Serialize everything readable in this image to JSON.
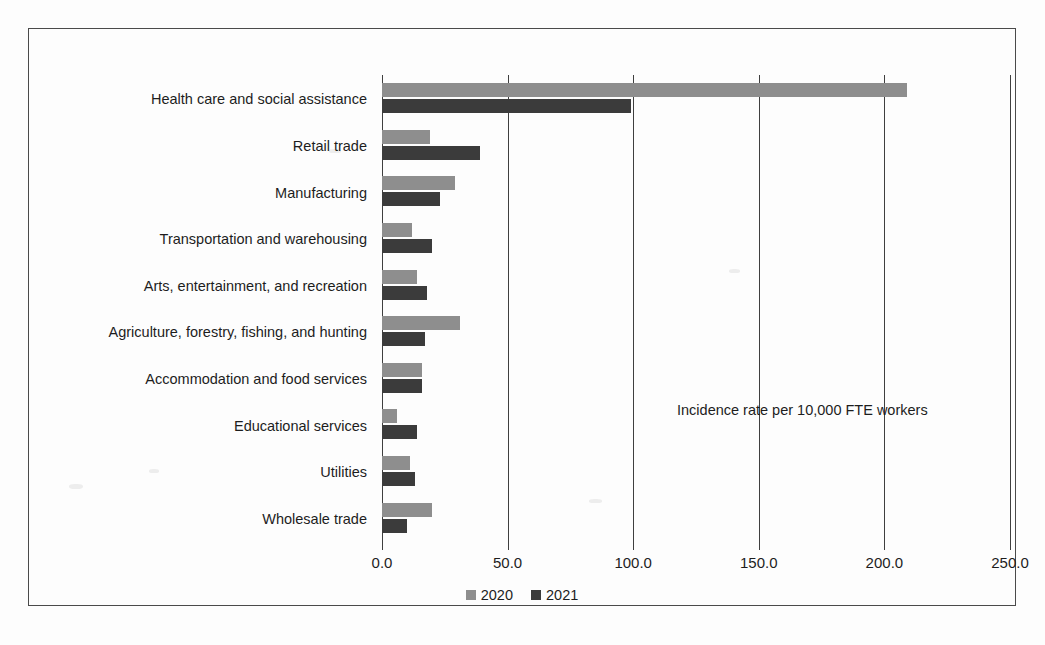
{
  "chart_data": {
    "type": "bar",
    "orientation": "horizontal",
    "title": "",
    "subtitle": "",
    "annotation": "Incidence rate per 10,000 FTE workers",
    "xlabel": "",
    "ylabel": "",
    "xlim": [
      0.0,
      250.0
    ],
    "xticks": [
      "0.0",
      "50.0",
      "100.0",
      "150.0",
      "200.0",
      "250.0"
    ],
    "xtick_values": [
      0,
      50,
      100,
      150,
      200,
      250
    ],
    "grid": "vertical",
    "legend_position": "bottom-center",
    "categories": [
      "Health care and social assistance",
      "Retail trade",
      "Manufacturing",
      "Transportation and warehousing",
      "Arts, entertainment, and recreation",
      "Agriculture, forestry, fishing, and hunting",
      "Accommodation and food services",
      "Educational services",
      "Utilities",
      "Wholesale trade"
    ],
    "series": [
      {
        "name": "2020",
        "color": "#8e8e8e",
        "values": [
          209.0,
          19.0,
          29.0,
          12.0,
          14.0,
          31.0,
          16.0,
          6.0,
          11.0,
          20.0
        ]
      },
      {
        "name": "2021",
        "color": "#3b3b3b",
        "values": [
          99.0,
          39.0,
          23.0,
          20.0,
          18.0,
          17.0,
          16.0,
          14.0,
          13.0,
          10.0
        ]
      }
    ]
  },
  "legend": {
    "items": [
      {
        "label": "2020",
        "swatch_class": "sw-2020"
      },
      {
        "label": "2021",
        "swatch_class": "sw-2021"
      }
    ]
  }
}
